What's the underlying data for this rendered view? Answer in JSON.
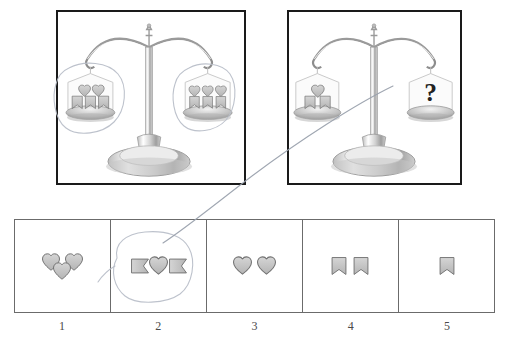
{
  "puzzle": {
    "type": "balance-scale-equivalence",
    "question_mark": "?",
    "scales": [
      {
        "id": "scale-given",
        "name": "given-balance",
        "left_pan": {
          "hearts": 2,
          "shields": 3,
          "description": "2 hearts over 3 shields"
        },
        "right_pan": {
          "hearts": 3,
          "shields": 3,
          "description": "3 heart-and-shield pairs"
        },
        "annotated": true
      },
      {
        "id": "scale-query",
        "name": "query-balance",
        "left_pan": {
          "hearts": 1,
          "shields": 2,
          "description": "1 heart over 2 shields"
        },
        "right_pan": {
          "unknown": "?",
          "description": "unknown quantity"
        },
        "annotated": false
      }
    ],
    "options": [
      {
        "number": "1",
        "name": "option-1",
        "shapes": "three-hearts",
        "hearts": 3,
        "shields": 0,
        "selected": false
      },
      {
        "number": "2",
        "name": "option-2",
        "shapes": "shield-heart-shield",
        "hearts": 1,
        "shields": 2,
        "selected": true
      },
      {
        "number": "3",
        "name": "option-3",
        "shapes": "two-hearts",
        "hearts": 2,
        "shields": 0,
        "selected": false
      },
      {
        "number": "4",
        "name": "option-4",
        "shapes": "two-shields",
        "hearts": 0,
        "shields": 2,
        "selected": false
      },
      {
        "number": "5",
        "name": "option-5",
        "shapes": "one-shield",
        "hearts": 0,
        "shields": 1,
        "selected": false
      }
    ],
    "annotations": {
      "circle_left_pan": "hand-drawn circle around left pan of given balance",
      "circle_right_pan": "hand-drawn circle around right pan of given balance",
      "circle_option_2": "hand-drawn circle around option 2",
      "connector_line": "hand-drawn line from question-mark pan to option 2"
    }
  },
  "colors": {
    "panel_border": "#1a1a1a",
    "option_border": "#6b6b6b",
    "annotation": "#b9bfc9",
    "shape_fill": "#c9c9c9",
    "shape_stroke": "#6e6e6e",
    "label_text": "#4a4a4a",
    "background": "#ffffff"
  }
}
